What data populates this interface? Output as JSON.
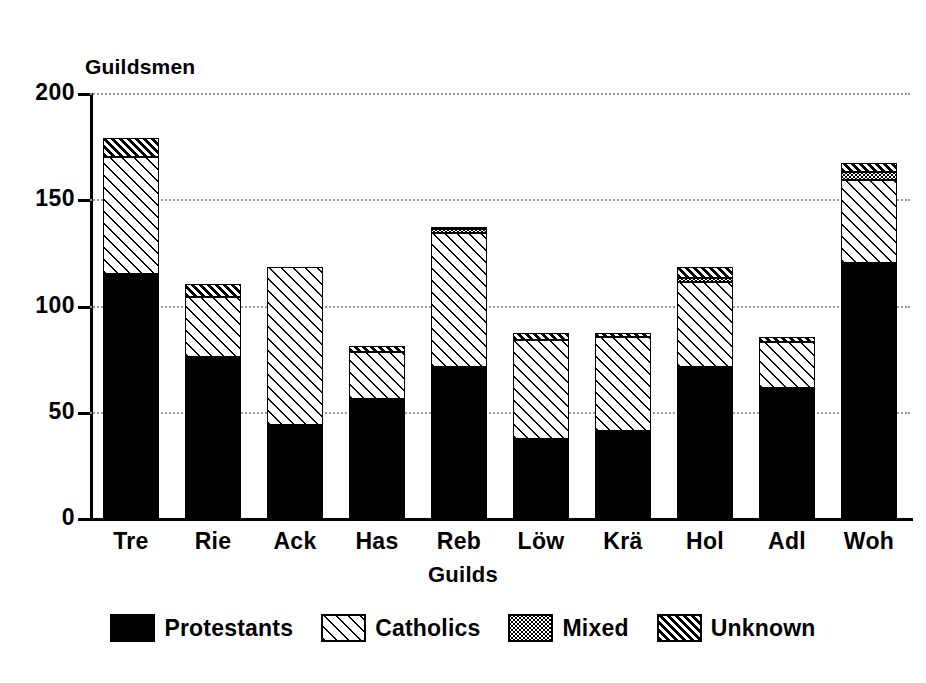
{
  "chart_data": {
    "type": "bar",
    "subtype": "stacked-bar",
    "title": "",
    "xlabel": "Guilds",
    "ylabel": "Guildsmen",
    "ylim": [
      0,
      200
    ],
    "yticks": [
      0,
      50,
      100,
      150,
      200
    ],
    "ytick_labels": [
      "0",
      "50",
      "100",
      "150",
      "200"
    ],
    "grid": true,
    "grid_style": "dotted horizontal gridlines",
    "legend_position": "bottom-center",
    "categories": [
      "Tre",
      "Rie",
      "Ack",
      "Has",
      "Reb",
      "Löw",
      "Krä",
      "Hol",
      "Adl",
      "Woh"
    ],
    "series": [
      {
        "name": "Protestants",
        "pattern": "solid-black",
        "color": "#000000",
        "values": [
          115,
          76,
          44,
          56,
          71,
          37,
          41,
          71,
          61,
          120
        ]
      },
      {
        "name": "Catholics",
        "pattern": "diagonal-hatch-sparse",
        "color": "#ffffff",
        "values": [
          55,
          28,
          74,
          22,
          63,
          47,
          44,
          40,
          22,
          39
        ]
      },
      {
        "name": "Mixed",
        "pattern": "dotted-stipple",
        "color": "#ffffff",
        "values": [
          0,
          0,
          0,
          0,
          2,
          0,
          0,
          2,
          0,
          4
        ]
      },
      {
        "name": "Unknown",
        "pattern": "diagonal-hatch-dense",
        "color": "#ffffff",
        "values": [
          9,
          6,
          0,
          3,
          1,
          3,
          2,
          5,
          2,
          4
        ]
      }
    ],
    "totals": [
      179,
      110,
      118,
      81,
      137,
      87,
      87,
      118,
      85,
      167
    ]
  },
  "axes": {
    "y_title": "Guildsmen",
    "x_title": "Guilds",
    "y_ticks": [
      {
        "label": "200",
        "value": 200
      },
      {
        "label": "150",
        "value": 150
      },
      {
        "label": "100",
        "value": 100
      },
      {
        "label": "50",
        "value": 50
      },
      {
        "label": "0",
        "value": 0
      }
    ],
    "x_ticks": [
      {
        "label": "Tre"
      },
      {
        "label": "Rie"
      },
      {
        "label": "Ack"
      },
      {
        "label": "Has"
      },
      {
        "label": "Reb"
      },
      {
        "label": "Löw"
      },
      {
        "label": "Krä"
      },
      {
        "label": "Hol"
      },
      {
        "label": "Adl"
      },
      {
        "label": "Woh"
      }
    ]
  },
  "legend": {
    "items": [
      {
        "label": "Protestants",
        "swatch": "solid-black-swatch"
      },
      {
        "label": "Catholics",
        "swatch": "diagonal-hatch-sparse-swatch"
      },
      {
        "label": "Mixed",
        "swatch": "dotted-stipple-swatch"
      },
      {
        "label": "Unknown",
        "swatch": "diagonal-hatch-dense-swatch"
      }
    ]
  }
}
